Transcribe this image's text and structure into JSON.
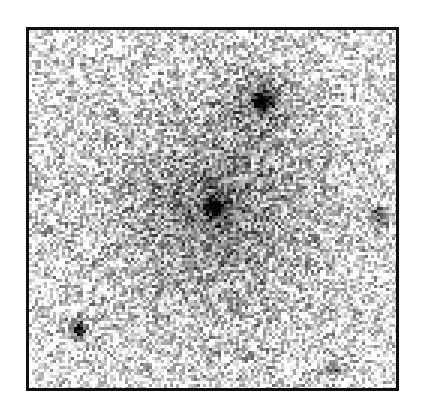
{
  "image": {
    "description": "Grayscale astronomical image of an elliptical galaxy with several nearby compact sources on a noisy background",
    "frame": {
      "x": 26,
      "y": 27,
      "width": 373,
      "height": 364,
      "border_color": "#111111",
      "border_width": 3
    },
    "background_color": "#ffffff",
    "noise_level": 0.42,
    "pixel_size": 3,
    "sources": [
      {
        "name": "central-galaxy",
        "x": 214,
        "y": 206,
        "peak": 1.0,
        "core_radius": 9,
        "halo_radius": 110,
        "halo_strength": 0.55
      },
      {
        "name": "top-companion",
        "x": 260,
        "y": 100,
        "peak": 0.75,
        "core_radius": 10,
        "halo_radius": 26,
        "halo_strength": 0.35
      },
      {
        "name": "bottom-left-star",
        "x": 78,
        "y": 328,
        "peak": 0.9,
        "core_radius": 6,
        "halo_radius": 14,
        "halo_strength": 0.3
      },
      {
        "name": "right-source",
        "x": 378,
        "y": 213,
        "peak": 0.6,
        "core_radius": 5,
        "halo_radius": 10,
        "halo_strength": 0.2
      },
      {
        "name": "bottom-right-faint",
        "x": 332,
        "y": 368,
        "peak": 0.35,
        "core_radius": 7,
        "halo_radius": 12,
        "halo_strength": 0.15
      }
    ]
  }
}
